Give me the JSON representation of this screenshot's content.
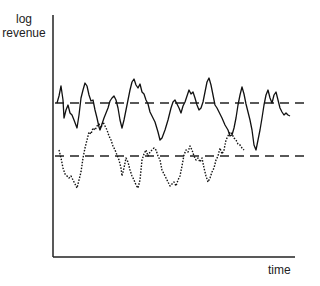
{
  "chart_data": {
    "type": "line",
    "title": "",
    "xlabel": "time",
    "ylabel": "log revenue",
    "ylabel_lines": [
      "log",
      "revenue"
    ],
    "grid": false,
    "legend": null,
    "x_ticks": [],
    "y_ticks": [],
    "reference_lines": [
      {
        "name": "upper-mean",
        "style": "dashed",
        "level_px": 103
      },
      {
        "name": "lower-mean",
        "style": "dashed",
        "level_px": 156
      }
    ],
    "series": [
      {
        "name": "solid-series",
        "style": "solid",
        "points_px": [
          [
            57,
            103
          ],
          [
            59,
            96
          ],
          [
            61,
            86
          ],
          [
            63,
            100
          ],
          [
            64,
            118
          ],
          [
            66,
            110
          ],
          [
            68,
            105
          ],
          [
            70,
            113
          ],
          [
            72,
            115
          ],
          [
            74,
            120
          ],
          [
            77,
            128
          ],
          [
            79,
            115
          ],
          [
            81,
            98
          ],
          [
            83,
            90
          ],
          [
            85,
            83
          ],
          [
            87,
            86
          ],
          [
            89,
            95
          ],
          [
            91,
            101
          ],
          [
            93,
            100
          ],
          [
            95,
            110
          ],
          [
            97,
            118
          ],
          [
            99,
            127
          ],
          [
            100,
            130
          ],
          [
            102,
            124
          ],
          [
            104,
            118
          ],
          [
            106,
            113
          ],
          [
            108,
            108
          ],
          [
            110,
            101
          ],
          [
            112,
            98
          ],
          [
            114,
            96
          ],
          [
            116,
            100
          ],
          [
            118,
            108
          ],
          [
            120,
            120
          ],
          [
            122,
            128
          ],
          [
            124,
            120
          ],
          [
            126,
            110
          ],
          [
            128,
            100
          ],
          [
            130,
            90
          ],
          [
            132,
            82
          ],
          [
            134,
            79
          ],
          [
            136,
            85
          ],
          [
            138,
            88
          ],
          [
            140,
            84
          ],
          [
            142,
            92
          ],
          [
            144,
            94
          ],
          [
            146,
            100
          ],
          [
            148,
            104
          ],
          [
            150,
            112
          ],
          [
            152,
            116
          ],
          [
            155,
            122
          ],
          [
            158,
            132
          ],
          [
            160,
            140
          ],
          [
            162,
            138
          ],
          [
            165,
            130
          ],
          [
            168,
            120
          ],
          [
            171,
            108
          ],
          [
            173,
            102
          ],
          [
            175,
            100
          ],
          [
            177,
            104
          ],
          [
            179,
            108
          ],
          [
            181,
            113
          ],
          [
            183,
            106
          ],
          [
            185,
            102
          ],
          [
            187,
            96
          ],
          [
            189,
            90
          ],
          [
            191,
            94
          ],
          [
            193,
            92
          ],
          [
            195,
            98
          ],
          [
            197,
            105
          ],
          [
            199,
            110
          ],
          [
            201,
            108
          ],
          [
            203,
            102
          ],
          [
            205,
            92
          ],
          [
            207,
            82
          ],
          [
            209,
            78
          ],
          [
            211,
            85
          ],
          [
            213,
            95
          ],
          [
            215,
            105
          ],
          [
            217,
            108
          ],
          [
            219,
            112
          ],
          [
            222,
            118
          ],
          [
            225,
            125
          ],
          [
            228,
            130
          ],
          [
            230,
            136
          ],
          [
            232,
            135
          ],
          [
            234,
            128
          ],
          [
            236,
            118
          ],
          [
            238,
            105
          ],
          [
            240,
            95
          ],
          [
            242,
            87
          ],
          [
            244,
            94
          ],
          [
            246,
            104
          ],
          [
            248,
            112
          ],
          [
            250,
            120
          ],
          [
            252,
            130
          ],
          [
            254,
            145
          ],
          [
            256,
            150
          ],
          [
            258,
            140
          ],
          [
            260,
            130
          ],
          [
            262,
            118
          ],
          [
            264,
            105
          ],
          [
            266,
            95
          ],
          [
            268,
            90
          ],
          [
            270,
            98
          ],
          [
            272,
            103
          ],
          [
            274,
            95
          ],
          [
            276,
            92
          ],
          [
            278,
            100
          ],
          [
            280,
            108
          ],
          [
            282,
            112
          ],
          [
            284,
            115
          ],
          [
            286,
            113
          ],
          [
            288,
            115
          ],
          [
            290,
            116
          ]
        ]
      },
      {
        "name": "dotted-series",
        "style": "dotted",
        "points_px": [
          [
            59,
            150
          ],
          [
            61,
            158
          ],
          [
            63,
            168
          ],
          [
            65,
            174
          ],
          [
            67,
            176
          ],
          [
            69,
            178
          ],
          [
            71,
            176
          ],
          [
            73,
            180
          ],
          [
            75,
            184
          ],
          [
            77,
            188
          ],
          [
            79,
            180
          ],
          [
            81,
            172
          ],
          [
            83,
            158
          ],
          [
            85,
            148
          ],
          [
            87,
            140
          ],
          [
            89,
            132
          ],
          [
            91,
            134
          ],
          [
            93,
            128
          ],
          [
            95,
            130
          ],
          [
            97,
            126
          ],
          [
            99,
            124
          ],
          [
            101,
            128
          ],
          [
            103,
            122
          ],
          [
            105,
            126
          ],
          [
            107,
            130
          ],
          [
            109,
            136
          ],
          [
            111,
            140
          ],
          [
            113,
            146
          ],
          [
            115,
            150
          ],
          [
            117,
            155
          ],
          [
            119,
            160
          ],
          [
            121,
            168
          ],
          [
            122,
            176
          ],
          [
            124,
            168
          ],
          [
            126,
            158
          ],
          [
            128,
            162
          ],
          [
            130,
            170
          ],
          [
            132,
            176
          ],
          [
            134,
            180
          ],
          [
            136,
            185
          ],
          [
            138,
            188
          ],
          [
            140,
            180
          ],
          [
            142,
            160
          ],
          [
            144,
            154
          ],
          [
            146,
            150
          ],
          [
            148,
            156
          ],
          [
            150,
            152
          ],
          [
            152,
            150
          ],
          [
            154,
            148
          ],
          [
            156,
            150
          ],
          [
            158,
            156
          ],
          [
            160,
            160
          ],
          [
            162,
            170
          ],
          [
            164,
            174
          ],
          [
            166,
            178
          ],
          [
            168,
            182
          ],
          [
            170,
            186
          ],
          [
            172,
            184
          ],
          [
            174,
            182
          ],
          [
            176,
            186
          ],
          [
            178,
            180
          ],
          [
            180,
            176
          ],
          [
            182,
            166
          ],
          [
            184,
            155
          ],
          [
            186,
            150
          ],
          [
            188,
            152
          ],
          [
            190,
            146
          ],
          [
            192,
            150
          ],
          [
            194,
            156
          ],
          [
            196,
            160
          ],
          [
            198,
            158
          ],
          [
            200,
            162
          ],
          [
            202,
            158
          ],
          [
            204,
            168
          ],
          [
            206,
            176
          ],
          [
            208,
            182
          ],
          [
            210,
            178
          ],
          [
            212,
            172
          ],
          [
            214,
            168
          ],
          [
            216,
            160
          ],
          [
            218,
            156
          ],
          [
            220,
            148
          ],
          [
            222,
            154
          ],
          [
            224,
            150
          ],
          [
            226,
            140
          ],
          [
            228,
            136
          ],
          [
            230,
            132
          ],
          [
            232,
            134
          ],
          [
            234,
            138
          ],
          [
            236,
            140
          ],
          [
            238,
            144
          ],
          [
            240,
            145
          ],
          [
            242,
            148
          ],
          [
            244,
            150
          ]
        ]
      }
    ]
  }
}
